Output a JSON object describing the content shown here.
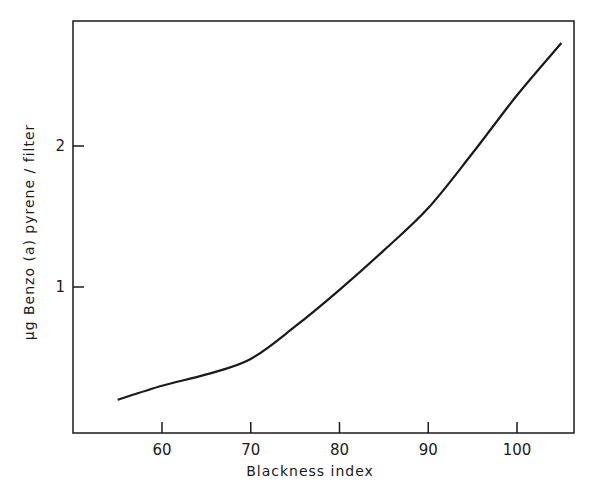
{
  "chart_data": {
    "type": "line",
    "title": "",
    "xlabel": "Blackness index",
    "ylabel": "μg Benzo (a) pyrene / filter",
    "xlim": [
      50,
      106
    ],
    "ylim": [
      0,
      2.85
    ],
    "x_ticks": [
      60,
      70,
      80,
      90,
      100
    ],
    "x_tick_labels": [
      "60",
      "70",
      "80",
      "90",
      "100"
    ],
    "y_ticks": [
      1,
      2
    ],
    "y_tick_labels": [
      "1",
      "2"
    ],
    "grid": false,
    "legend": null,
    "series": [
      {
        "name": "Benzo(a)pyrene vs blackness index",
        "x": [
          55,
          60,
          65,
          70,
          75,
          80,
          85,
          90,
          95,
          100,
          105
        ],
        "y": [
          0.2,
          0.3,
          0.38,
          0.49,
          0.72,
          0.98,
          1.26,
          1.56,
          1.95,
          2.36,
          2.73
        ]
      }
    ]
  }
}
